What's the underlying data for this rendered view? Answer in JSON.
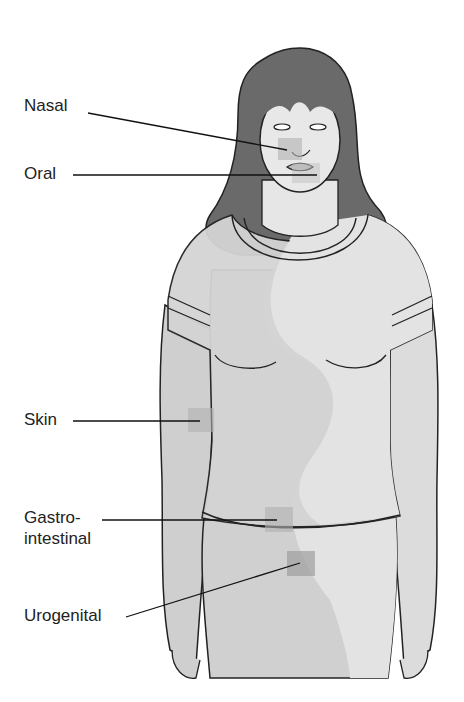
{
  "diagram": {
    "type": "anatomical-labeled-illustration",
    "labels": [
      {
        "id": "nasal",
        "text": "Nasal",
        "x": 24,
        "y": 105
      },
      {
        "id": "oral",
        "text": "Oral",
        "x": 24,
        "y": 164
      },
      {
        "id": "skin",
        "text": "Skin",
        "x": 24,
        "y": 411
      },
      {
        "id": "gastro",
        "text": "Gastro-",
        "x": 24,
        "y": 508
      },
      {
        "id": "intestinal",
        "text": "intestinal",
        "x": 24,
        "y": 530
      },
      {
        "id": "urogenital",
        "text": "Urogenital",
        "x": 24,
        "y": 607
      }
    ],
    "sites": [
      "Nasal",
      "Oral",
      "Skin",
      "Gastrointestinal",
      "Urogenital"
    ],
    "colors": {
      "background": "#ffffff",
      "outline": "#222222",
      "hair": "#6a6a6a",
      "skin_light": "#e4e4e4",
      "body_tone": "#cfcfcf",
      "shadow": "#bdbdbd",
      "site_marker": "#b0b0b0"
    }
  }
}
